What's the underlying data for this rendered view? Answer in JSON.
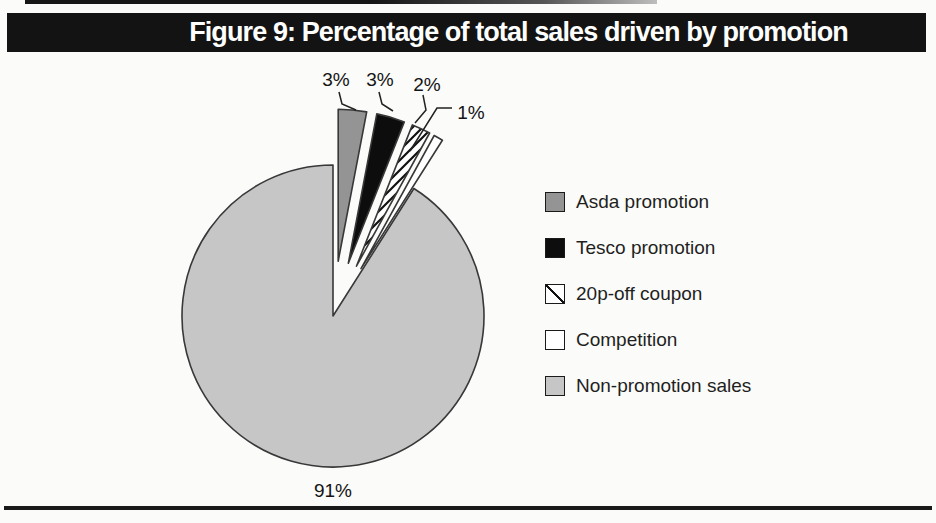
{
  "figure_header": {
    "title": "Figure 9: Percentage of total sales driven by promotion",
    "bar_color": "#131313",
    "text_color": "#ffffff"
  },
  "chart_data": {
    "type": "pie",
    "title": "Figure 9: Percentage of total sales driven by promotion",
    "unit": "percent of total sales",
    "start_angle_deg": 0,
    "direction": "clockwise",
    "legend_position": "right",
    "slices": [
      {
        "label": "Asda promotion",
        "value": 3,
        "display": "3%",
        "color": "#949494",
        "pattern": "solid",
        "exploded": true
      },
      {
        "label": "Tesco promotion",
        "value": 3,
        "display": "3%",
        "color": "#0d0d0d",
        "pattern": "solid",
        "exploded": true
      },
      {
        "label": "20p-off coupon",
        "value": 2,
        "display": "2%",
        "color": "#ffffff",
        "pattern": "diagonal-hatch",
        "exploded": true
      },
      {
        "label": "Competition",
        "value": 1,
        "display": "1%",
        "color": "#ffffff",
        "pattern": "solid",
        "exploded": true
      },
      {
        "label": "Non-promotion sales",
        "value": 91,
        "display": "91%",
        "color": "#c6c6c6",
        "pattern": "solid",
        "exploded": false
      }
    ],
    "colors": {
      "outline": "#383838",
      "hatch_lines": "#111111",
      "label_text": "#141414",
      "leader_lines": "#222222"
    }
  }
}
